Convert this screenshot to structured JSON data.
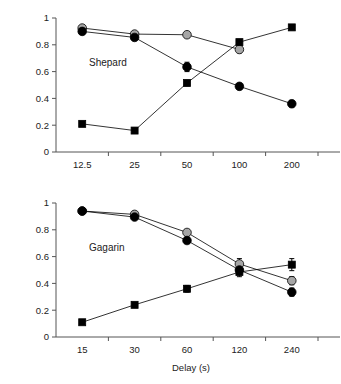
{
  "figure": {
    "ylabel": "Proportion Correct or Declined",
    "xlabel": "Delay (s)"
  },
  "chart_data": [
    {
      "type": "line",
      "title": "Shepard",
      "panel_label": "Shepard",
      "xlabel": "",
      "ylabel": "Proportion Correct or Declined",
      "categories": [
        "12.5",
        "25",
        "50",
        "100",
        "200"
      ],
      "x": [
        12.5,
        25,
        50,
        100,
        200
      ],
      "xscale": "categorical",
      "ylim": [
        0,
        1
      ],
      "yticks": [
        0,
        0.2,
        0.4,
        0.6,
        0.8,
        1
      ],
      "ytick_labels": [
        "0",
        "0.2",
        "0.4",
        "0.6",
        "0.8",
        "1"
      ],
      "grid": false,
      "legend": "none",
      "series": [
        {
          "name": "gray-circle",
          "marker": "circle",
          "marker_fill": "#a6a6a6",
          "marker_edge": "#000000",
          "values": [
            0.925,
            0.88,
            0.875,
            0.765,
            null
          ],
          "errors": [
            0.0,
            0.0,
            0.0,
            0.025,
            null
          ]
        },
        {
          "name": "black-circle",
          "marker": "circle",
          "marker_fill": "#000000",
          "marker_edge": "#000000",
          "values": [
            0.9,
            0.855,
            0.635,
            0.49,
            0.36
          ],
          "errors": [
            0.015,
            0.015,
            0.035,
            0.02,
            0.025
          ]
        },
        {
          "name": "black-square",
          "marker": "square",
          "marker_fill": "#000000",
          "marker_edge": "#000000",
          "values": [
            0.21,
            0.16,
            0.515,
            0.82,
            0.93
          ],
          "errors": [
            0.0,
            0.0,
            0.02,
            0.015,
            0.0
          ]
        }
      ]
    },
    {
      "type": "line",
      "title": "Gagarin",
      "panel_label": "Gagarin",
      "xlabel": "Delay (s)",
      "ylabel": "Proportion Correct or Declined",
      "categories": [
        "15",
        "30",
        "60",
        "120",
        "240"
      ],
      "x": [
        15,
        30,
        60,
        120,
        240
      ],
      "xscale": "categorical",
      "ylim": [
        0,
        1
      ],
      "yticks": [
        0,
        0.2,
        0.4,
        0.6,
        0.8,
        1
      ],
      "ytick_labels": [
        "0",
        "0.2",
        "0.4",
        "0.6",
        "0.8",
        "1"
      ],
      "grid": false,
      "legend": "none",
      "series": [
        {
          "name": "gray-circle",
          "marker": "circle",
          "marker_fill": "#a6a6a6",
          "marker_edge": "#000000",
          "values": [
            0.94,
            0.915,
            0.78,
            0.545,
            0.42
          ],
          "errors": [
            0.0,
            0.0,
            0.015,
            0.04,
            0.03
          ]
        },
        {
          "name": "black-circle",
          "marker": "circle",
          "marker_fill": "#000000",
          "marker_edge": "#000000",
          "values": [
            0.94,
            0.895,
            0.72,
            0.5,
            0.335
          ],
          "errors": [
            0.01,
            0.015,
            0.02,
            0.035,
            0.03
          ]
        },
        {
          "name": "black-square",
          "marker": "square",
          "marker_fill": "#000000",
          "marker_edge": "#000000",
          "values": [
            0.11,
            0.24,
            0.36,
            0.485,
            0.54
          ],
          "errors": [
            0.0,
            0.015,
            0.025,
            0.035,
            0.045
          ]
        }
      ]
    }
  ]
}
